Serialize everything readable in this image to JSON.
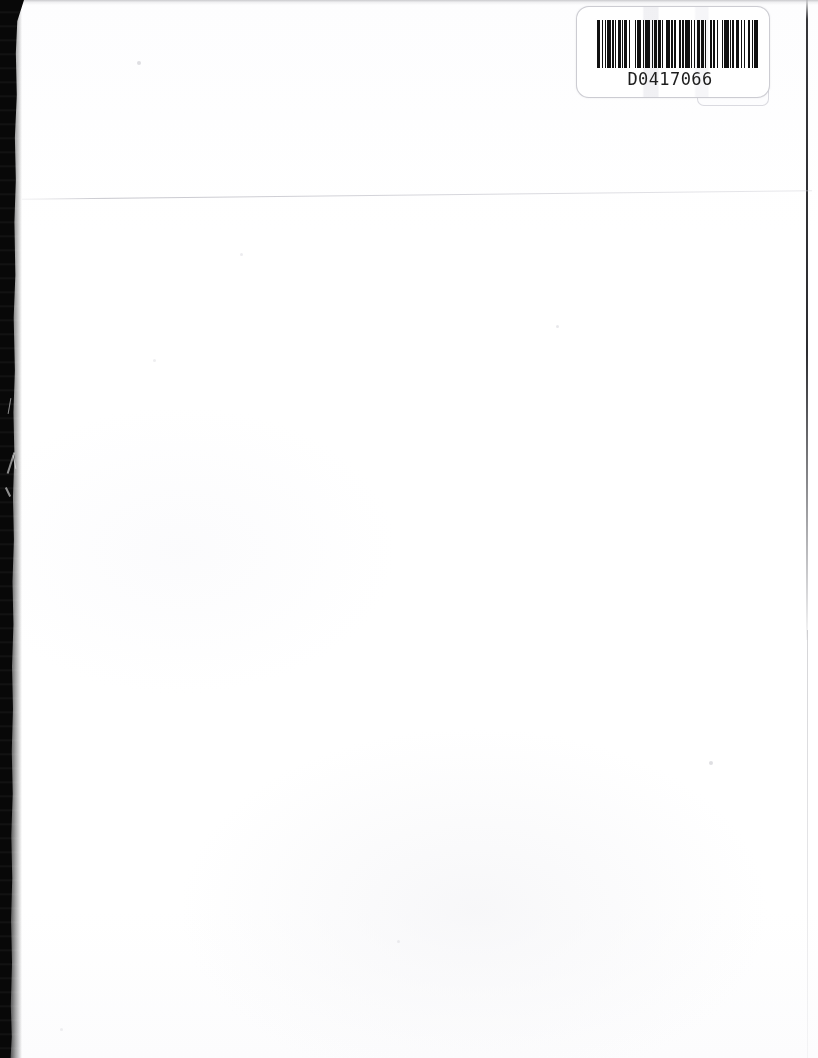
{
  "document": {
    "kind": "scanned-blank-page",
    "page_background_color": "#ffffff",
    "scan_edge_color": "#080808"
  },
  "barcode_label": {
    "number": "D0417066",
    "symbology_name": "barcode-code39",
    "ink_color": "#101010",
    "label_background_color": "#ffffff",
    "bars": [
      3,
      1,
      1,
      2,
      1,
      1,
      3,
      1,
      2,
      1,
      1,
      1,
      3,
      1,
      1,
      1,
      2,
      2,
      1,
      4,
      1,
      1,
      3,
      2,
      1,
      1,
      4,
      2,
      1,
      1,
      2,
      1,
      3,
      1,
      1,
      2,
      4,
      1,
      1,
      1,
      2,
      3,
      1,
      1,
      2,
      1,
      4,
      1,
      1,
      2,
      1,
      1,
      3,
      1,
      2,
      1,
      1,
      4,
      1,
      1,
      2,
      2,
      1,
      3,
      1,
      1,
      4,
      1,
      1,
      1,
      2,
      1,
      3,
      2,
      1,
      1,
      1,
      3,
      2,
      1,
      1,
      1,
      4,
      1
    ]
  },
  "artifacts": {
    "left_strip_label": "scanner-edge-strip",
    "right_edge_line_label": "page-edge-line",
    "fold_line_label": "page-fold-line",
    "speck_label": "dust-speck"
  }
}
